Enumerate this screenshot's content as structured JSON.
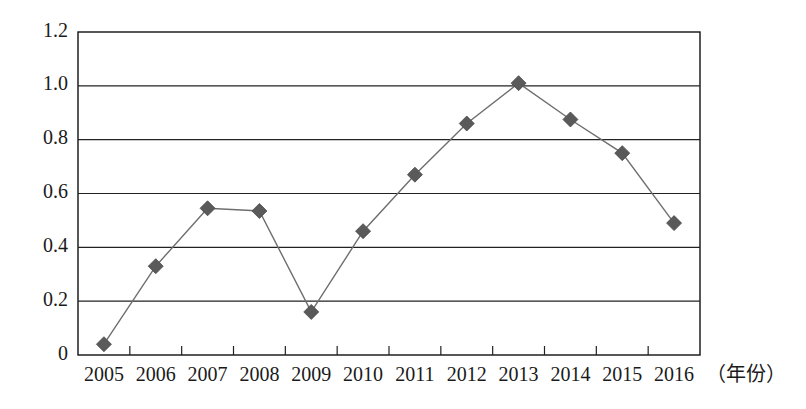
{
  "chart_data": {
    "type": "line",
    "title": "",
    "subtitle": "",
    "xlabel": "（年份）",
    "ylabel": "",
    "categories": [
      "2005",
      "2006",
      "2007",
      "2008",
      "2009",
      "2010",
      "2011",
      "2012",
      "2013",
      "2014",
      "2015",
      "2016"
    ],
    "values": [
      0.04,
      0.33,
      0.545,
      0.535,
      0.16,
      0.46,
      0.67,
      0.86,
      1.01,
      0.875,
      0.75,
      0.49
    ],
    "series": [
      {
        "name": "",
        "values": [
          0.04,
          0.33,
          0.545,
          0.535,
          0.16,
          0.46,
          0.67,
          0.86,
          1.01,
          0.875,
          0.75,
          0.49
        ]
      }
    ],
    "ylim": [
      0,
      1.2
    ],
    "ytick_labels": [
      "0",
      "0.2",
      "0.4",
      "0.6",
      "0.8",
      "1.0",
      "1.2"
    ],
    "ytick_values": [
      0,
      0.2,
      0.4,
      0.6,
      0.8,
      1.0,
      1.2
    ],
    "grid": "horizontal",
    "legend": "none",
    "marker_style": "diamond",
    "marker_color": "#5a5a5a",
    "line_color": "#6e6e6e",
    "axis_color": "#111111",
    "background_color": "#ffffff"
  },
  "axis_unit": {
    "x": "（年份）"
  }
}
